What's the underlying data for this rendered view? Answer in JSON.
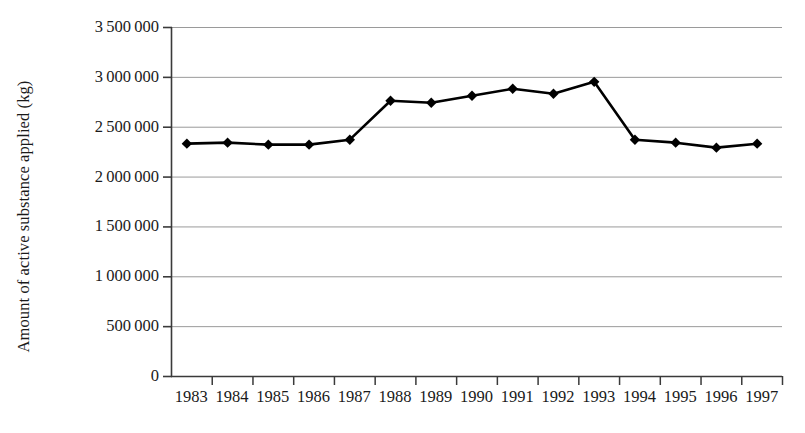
{
  "chart_data": {
    "type": "line",
    "title": "",
    "xlabel": "",
    "ylabel": "Amount of active substance applied (kg)",
    "categories": [
      "1983",
      "1984",
      "1985",
      "1986",
      "1987",
      "1988",
      "1989",
      "1990",
      "1991",
      "1992",
      "1993",
      "1994",
      "1995",
      "1996",
      "1997"
    ],
    "values": [
      2330000,
      2340000,
      2320000,
      2320000,
      2370000,
      2760000,
      2740000,
      2810000,
      2880000,
      2830000,
      2950000,
      2370000,
      2340000,
      2290000,
      2330000
    ],
    "ylim": [
      0,
      3500000
    ],
    "ytick_values": [
      0,
      500000,
      1000000,
      1500000,
      2000000,
      2500000,
      3000000,
      3500000
    ],
    "ytick_labels": [
      "0",
      "500 000",
      "1 000 000",
      "1 500 000",
      "2 000 000",
      "2 500 000",
      "3 000 000",
      "3 500 000"
    ],
    "grid": "horizontal",
    "legend": "none",
    "marker": "diamond",
    "series_color": "#000000",
    "grid_color": "#9a9a9a",
    "axis_color": "#3a3a3a"
  }
}
